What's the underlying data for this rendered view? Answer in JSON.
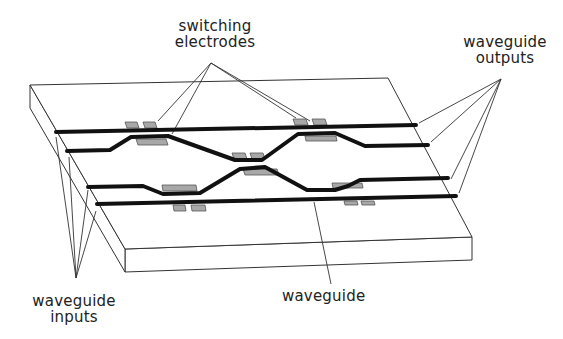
{
  "diagram": {
    "type": "optical-switch-schematic",
    "labels": {
      "switching_electrodes": [
        "switching",
        "electrodes"
      ],
      "waveguide_outputs": [
        "waveguide",
        "outputs"
      ],
      "waveguide_inputs": [
        "waveguide",
        "inputs"
      ],
      "waveguide": "waveguide"
    },
    "colors": {
      "line": "#222222",
      "waveguide": "#111111",
      "electrode_fill": "#a8a8a8",
      "electrode_stroke": "#555555",
      "slab_fill": "#ffffff",
      "background": "#ffffff"
    },
    "components": {
      "waveguide_count": 4,
      "electrode_pairs": 6
    }
  }
}
